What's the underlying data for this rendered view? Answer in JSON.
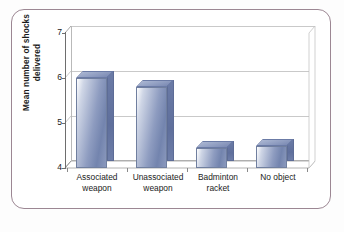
{
  "figure": {
    "frame_color": "#9c8793",
    "background": "#ffffff"
  },
  "chart_data": {
    "type": "bar",
    "title": "",
    "subtitle": "",
    "xlabel": "",
    "ylabel": "Mean number of shocks delivered",
    "ylabel_lines": [
      "Mean number of shocks",
      "delivered"
    ],
    "categories": [
      "Associated weapon",
      "Unassociated weapon",
      "Badminton racket",
      "No object"
    ],
    "category_lines": [
      [
        "Associated",
        "weapon"
      ],
      [
        "Unassociated",
        "weapon"
      ],
      [
        "Badminton",
        "racket"
      ],
      [
        "No object"
      ]
    ],
    "values": [
      6.0,
      5.8,
      4.45,
      4.5
    ],
    "ylim": [
      4,
      7
    ],
    "yticks": [
      4,
      5,
      6,
      7
    ],
    "ytick_labels": [
      "4",
      "5",
      "6",
      "7"
    ],
    "grid": true,
    "grid_axis": "y",
    "legend": "none",
    "three_d": true,
    "series_name": "Mean number of shocks delivered",
    "bar_colors": {
      "front_light": "#ffffff",
      "front_mid": "#8e9cc0",
      "front_dark": "#7384ae",
      "side": "#5f6f9c",
      "top": "#8e9cc0",
      "edge": "#6b7ba6"
    }
  }
}
